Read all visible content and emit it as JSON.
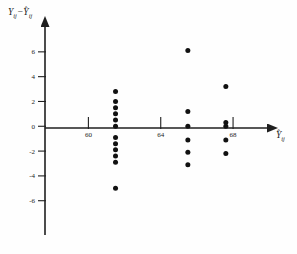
{
  "figure": {
    "kind": "residual-scatter-plot",
    "background_color": "#fefefe",
    "ink_color": "#111111"
  },
  "axes": {
    "y_label": "Y",
    "y_label_sub": "ij",
    "y_label_minus": "−",
    "y_label_hat_base": "Y",
    "y_label_hat_sub": "ij",
    "x_label_hat_base": "Y",
    "x_label_sub": "ij",
    "hat_glyph": "ˆ",
    "x_arrow": "arrow-right",
    "y_arrow": "arrow-up"
  },
  "chart_data": {
    "type": "scatter",
    "title": "",
    "xlabel": "Ŷij",
    "ylabel": "Yij − Ŷij",
    "xlim": [
      57.6,
      69.6
    ],
    "ylim": [
      -8.2,
      7.6
    ],
    "grid": false,
    "legend": null,
    "xticks": [
      60,
      64,
      68
    ],
    "xtick_labels": [
      "60",
      "64",
      "68"
    ],
    "yticks": [
      6,
      4,
      2,
      0,
      -2,
      -4,
      -6
    ],
    "ytick_labels": [
      "6",
      "4",
      "2",
      "0",
      "-2",
      "-4",
      "-6"
    ],
    "series": [
      {
        "name": "residuals",
        "marker": "filled-circle",
        "marker_color": "#111111",
        "points": [
          [
            61.5,
            2.8
          ],
          [
            61.5,
            2.0
          ],
          [
            61.5,
            1.5
          ],
          [
            61.5,
            1.0
          ],
          [
            61.5,
            0.5
          ],
          [
            61.5,
            0.0
          ],
          [
            61.5,
            -0.9
          ],
          [
            61.5,
            -1.4
          ],
          [
            61.5,
            -1.9
          ],
          [
            61.5,
            -2.4
          ],
          [
            61.5,
            -2.9
          ],
          [
            61.5,
            -5.0
          ],
          [
            65.5,
            6.1
          ],
          [
            65.5,
            1.2
          ],
          [
            65.5,
            0.0
          ],
          [
            65.5,
            -1.1
          ],
          [
            65.5,
            -2.1
          ],
          [
            65.5,
            -3.1
          ],
          [
            67.6,
            3.2
          ],
          [
            67.6,
            0.3
          ],
          [
            67.6,
            0.0
          ],
          [
            67.6,
            -1.1
          ],
          [
            67.6,
            -2.2
          ]
        ]
      }
    ]
  }
}
